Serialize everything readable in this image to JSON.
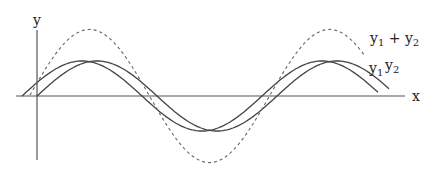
{
  "diagram": {
    "title": "",
    "axes": {
      "x_label": "x",
      "y_label": "y"
    },
    "curves": [
      {
        "name": "y1",
        "label": "y1",
        "style": "solid",
        "phase_px": 22,
        "amplitude_px": 35
      },
      {
        "name": "y2",
        "label": "y2",
        "style": "solid",
        "phase_px": 37,
        "amplitude_px": 35
      },
      {
        "name": "y1+y2",
        "label": "y1 + y2",
        "style": "dashed",
        "amplitude_px": 70
      }
    ],
    "labels": {
      "y1_base": "y",
      "y1_sub": "1",
      "y2_base": "y",
      "y2_sub": "2",
      "sum_a_base": "y",
      "sum_a_sub": "1",
      "sum_plus": " + ",
      "sum_b_base": "y",
      "sum_b_sub": "2"
    },
    "colors": {
      "curve": "#444444",
      "axis": "#555555",
      "dashed": "#666666"
    }
  }
}
